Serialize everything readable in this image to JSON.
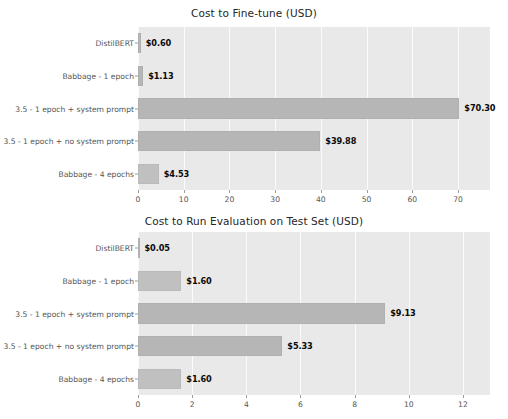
{
  "figure": {
    "width": 508,
    "height": 419,
    "background_color": "#ffffff",
    "plot_background_color": "#e9e9e9",
    "bar_color": "#b6b6b6",
    "grid_color": "#fbfbfb",
    "tick_label_color": "#555555",
    "value_label_color": "#0a0a0a"
  },
  "chart_data": [
    {
      "type": "bar",
      "orientation": "horizontal",
      "title": "Cost to Fine-tune (USD)",
      "xlabel": "",
      "ylabel": "",
      "categories": [
        "DistilBERT",
        "Babbage - 1 epoch",
        "3.5 - 1 epoch + system prompt",
        "3.5 - 1 epoch + no system prompt",
        "Babbage - 4 epochs"
      ],
      "values": [
        0.6,
        1.13,
        70.3,
        39.88,
        4.53
      ],
      "value_labels": [
        "$0.60",
        "$1.13",
        "$70.30",
        "$39.88",
        "$4.53"
      ],
      "xticks": [
        0,
        10,
        20,
        30,
        40,
        50,
        60,
        70
      ],
      "xtick_labels": [
        "0",
        "10",
        "20",
        "30",
        "40",
        "50",
        "60",
        "70"
      ],
      "xlim": [
        0,
        77
      ],
      "grid": true,
      "legend": false
    },
    {
      "type": "bar",
      "orientation": "horizontal",
      "title": "Cost to Run Evaluation on Test Set (USD)",
      "xlabel": "",
      "ylabel": "",
      "categories": [
        "DistilBERT",
        "Babbage - 1 epoch",
        "3.5 - 1 epoch + system prompt",
        "3.5 - 1 epoch + no system prompt",
        "Babbage - 4 epochs"
      ],
      "values": [
        0.05,
        1.6,
        9.13,
        5.33,
        1.6
      ],
      "value_labels": [
        "$0.05",
        "$1.60",
        "$9.13",
        "$5.33",
        "$1.60"
      ],
      "xticks": [
        0,
        2,
        4,
        6,
        8,
        10,
        12
      ],
      "xtick_labels": [
        "0",
        "2",
        "4",
        "6",
        "8",
        "10",
        "12"
      ],
      "xlim": [
        0,
        13
      ],
      "grid": true,
      "legend": false
    }
  ]
}
